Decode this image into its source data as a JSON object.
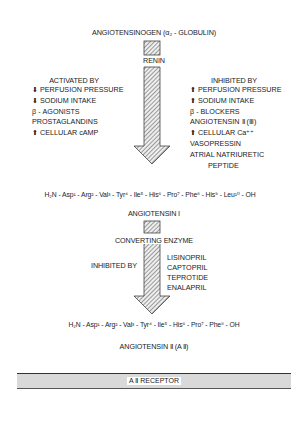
{
  "title": "ANGIOTENSINOGEN (α₂ - GLOBULIN)",
  "enzyme1": "RENIN",
  "activated": {
    "heading": "ACTIVATED BY",
    "items": [
      "⬇ PERFUSION PRESSURE",
      "⬇ SODIUM INTAKE",
      "β - AGONISTS",
      "PROSTAGLANDINS",
      "⬆ CELLULAR cAMP"
    ]
  },
  "inhibited": {
    "heading": "INHIBITED BY",
    "items": [
      "⬆ PERFUSION PRESSURE",
      "⬆ SODIUM INTAKE",
      "β - BLOCKERS",
      "ANGIOTENSIN Ⅱ (Ⅲ)",
      "⬆ CELLULAR Ca⁺⁺",
      "VASOPRESSIN",
      "ATRIAL NATRIURETIC",
      "PEPTIDE"
    ]
  },
  "peptide1": "H₂N - Asp¹ - Arg² - Val³ - Tyr⁴ - Ile⁵ - His⁶ - Pro⁷ - Phe⁸ - His⁹ - Leu¹⁰ - OH",
  "product1": "ANGIOTENSIN Ⅰ",
  "enzyme2": "CONVERTING ENZYME",
  "ace": {
    "heading": "INHIBITED BY",
    "items": [
      "LISINOPRIL",
      "CAPTOPRIL",
      "TEPROTIDE",
      "ENALAPRIL"
    ]
  },
  "peptide2": "H₂N - Asp¹ - Arg² - Val³ - Tyr⁴ - Ile⁵ - His⁶ - Pro⁷ - Phe⁸ - OH",
  "product2": "ANGIOTENSIN Ⅱ (A Ⅱ)",
  "receptor": "A Ⅱ RECEPTOR"
}
